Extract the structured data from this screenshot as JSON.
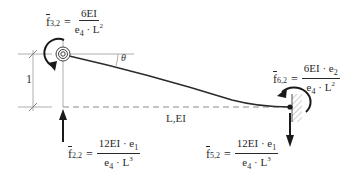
{
  "diagram": {
    "type": "beam-stiffness-diagram",
    "colors": {
      "line": "#2a2a2a",
      "guide": "#9a9a9a",
      "dashed": "#8a8a8a"
    },
    "formulas": {
      "f32": {
        "symbol": "f",
        "subscript": "3,2",
        "numerator": "6EI",
        "denominator_base": "e",
        "denominator_sub": "4",
        "denominator_rest": " · L",
        "denominator_exp": "2"
      },
      "f62": {
        "symbol": "f",
        "subscript": "6,2",
        "numerator": "6EI · e",
        "numerator_sub": "2",
        "denominator_base": "e",
        "denominator_sub": "4",
        "denominator_rest": " · L",
        "denominator_exp": "2"
      },
      "f22": {
        "symbol": "f",
        "subscript": "2,2",
        "numerator": "12EI · e",
        "numerator_sub": "1",
        "denominator_base": "e",
        "denominator_sub": "4",
        "denominator_rest": " · L",
        "denominator_exp": "3"
      },
      "f52": {
        "symbol": "f",
        "subscript": "5,2",
        "numerator": "12EI · e",
        "numerator_sub": "1",
        "denominator_base": "e",
        "denominator_sub": "4",
        "denominator_rest": " · L",
        "denominator_exp": "3"
      }
    },
    "labels": {
      "theta": "θ",
      "unit_displacement": "1",
      "beam": "L,EI"
    },
    "equals": "="
  }
}
